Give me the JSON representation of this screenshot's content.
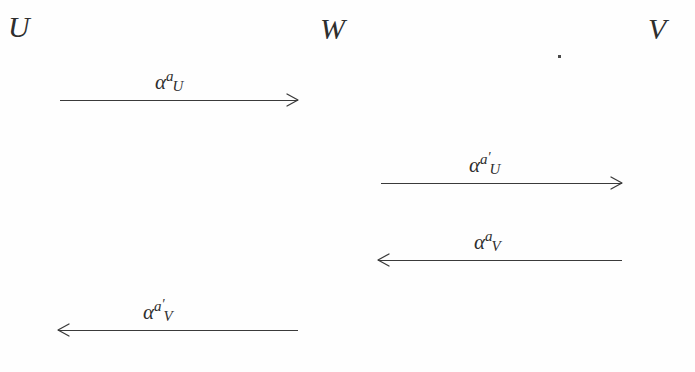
{
  "diagram": {
    "type": "morphism-diagram",
    "background_color": "#fefefe",
    "ink_color": "#2e2e2e",
    "objects": [
      {
        "id": "U",
        "label": "U",
        "x": 8,
        "y": 12
      },
      {
        "id": "W",
        "label": "W",
        "x": 320,
        "y": 14
      },
      {
        "id": "V",
        "label": "V",
        "x": 648,
        "y": 14
      }
    ],
    "arrows": [
      {
        "id": "u-to-w",
        "from": "U",
        "to": "W",
        "direction": "right",
        "x": 60,
        "y": 100,
        "length": 238,
        "label": {
          "base": "α",
          "sup": "a",
          "prime": "",
          "sub": "U"
        },
        "label_text": "α^{a_U}",
        "label_offset": 95
      },
      {
        "id": "w-to-v",
        "from": "W",
        "to": "V",
        "direction": "right",
        "x": 381,
        "y": 183,
        "length": 241,
        "label": {
          "base": "α",
          "sup": "a",
          "prime": "′",
          "sub": "U"
        },
        "label_text": "α^{a′_U}",
        "label_offset": 88
      },
      {
        "id": "v-to-w",
        "from": "V",
        "to": "W",
        "direction": "left",
        "x": 378,
        "y": 260,
        "length": 244,
        "label": {
          "base": "α",
          "sup": "a",
          "prime": "",
          "sub": "V"
        },
        "label_text": "α^{a_V}",
        "label_offset": 96
      },
      {
        "id": "w-to-u",
        "from": "W",
        "to": "U",
        "direction": "left",
        "x": 58,
        "y": 330,
        "length": 240,
        "label": {
          "base": "α",
          "sup": "a",
          "prime": "′",
          "sub": "V"
        },
        "label_text": "α^{a′_V}",
        "label_offset": 85
      }
    ],
    "artifacts": [
      {
        "id": "scan-speck",
        "x": 558,
        "y": 55
      }
    ]
  }
}
